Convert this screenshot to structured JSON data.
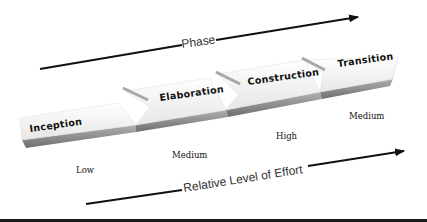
{
  "diagram": {
    "top_arrow": {
      "label": "Phase"
    },
    "bottom_arrow": {
      "label": "Relative Level of Effort"
    },
    "phases": [
      {
        "label": "Inception",
        "effort": "Low"
      },
      {
        "label": "Elaboration",
        "effort": "Medium"
      },
      {
        "label": "Construction",
        "effort": "High"
      },
      {
        "label": "Transition",
        "effort": "Medium"
      }
    ],
    "colors": {
      "arrow": "#111111",
      "chevron_face": "#f4f4f4",
      "chevron_side": "#8a8a8a",
      "text": "#111111"
    }
  }
}
